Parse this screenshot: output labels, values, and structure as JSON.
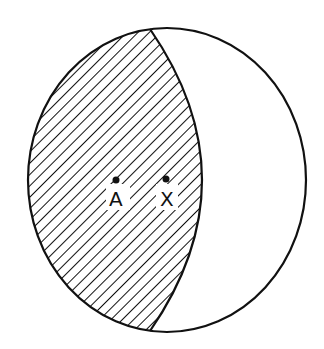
{
  "diagram": {
    "type": "region-diagram",
    "outer_circle": {
      "cx": 167,
      "cy": 180,
      "rx": 139,
      "ry": 152,
      "stroke": "#111111"
    },
    "inner_arc": {
      "top": [
        150,
        29
      ],
      "bottom": [
        150,
        331
      ],
      "bulge_x": 202
    },
    "shaded_region": {
      "pattern": "diagonal-hatch",
      "color": "#111111"
    },
    "points": [
      {
        "label": "A",
        "x": 116,
        "y": 180
      },
      {
        "label": "X",
        "x": 166,
        "y": 179
      }
    ]
  }
}
